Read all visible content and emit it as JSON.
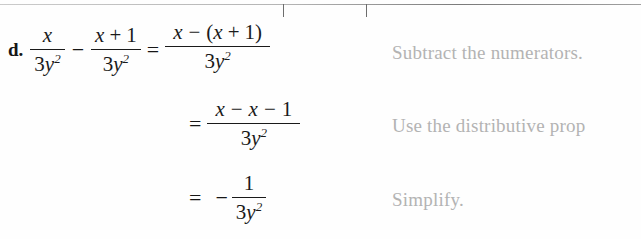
{
  "page": {
    "background_color": "#fefefe",
    "text_color": "#161616",
    "annotation_color": "#b3b3b3",
    "width": 641,
    "height": 239
  },
  "example": {
    "label": "d."
  },
  "line1": {
    "frac1": {
      "numerator": "x",
      "den_coeff": "3",
      "den_var": "y",
      "den_exp": "2"
    },
    "operator": "−",
    "frac2": {
      "num_var": "x",
      "num_op": "+",
      "num_const": "1",
      "den_coeff": "3",
      "den_var": "y",
      "den_exp": "2"
    },
    "equals": "=",
    "result": {
      "num_a": "x",
      "num_op": "−",
      "num_paren_open": "(",
      "num_b": "x",
      "num_op2": "+",
      "num_c": "1",
      "num_paren_close": ")",
      "den_coeff": "3",
      "den_var": "y",
      "den_exp": "2"
    },
    "annotation": "Subtract the numerators."
  },
  "line2": {
    "equals": "=",
    "result": {
      "num_a": "x",
      "num_op": "−",
      "num_b": "x",
      "num_op2": "−",
      "num_c": "1",
      "den_coeff": "3",
      "den_var": "y",
      "den_exp": "2"
    },
    "annotation": "Use the distributive prop"
  },
  "line3": {
    "equals": "=",
    "sign": "−",
    "result": {
      "numerator": "1",
      "den_coeff": "3",
      "den_var": "y",
      "den_exp": "2"
    },
    "annotation": "Simplify."
  },
  "artifact": {
    "name": "top-scan-line-bracket",
    "tick_left_x": 283,
    "tick_right_x": 366,
    "tick_height": 13
  }
}
